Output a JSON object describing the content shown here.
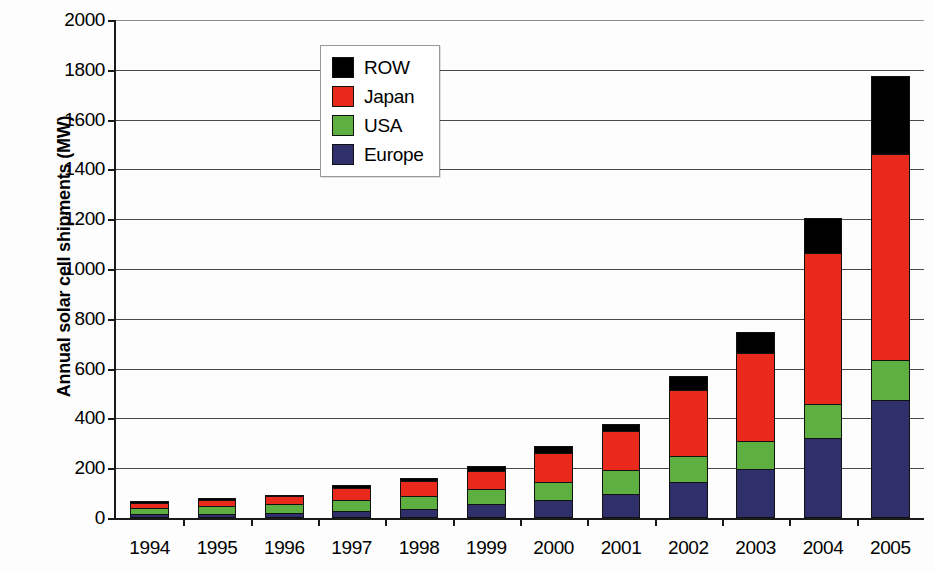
{
  "chart_data": {
    "type": "bar",
    "stacked": true,
    "title": "",
    "xlabel": "",
    "ylabel": "Annual solar cell shipments (MW)",
    "ylim": [
      0,
      2000
    ],
    "yticks": [
      0,
      200,
      400,
      600,
      800,
      1000,
      1200,
      1400,
      1600,
      1800,
      2000
    ],
    "grid": true,
    "legend_position": "top-left-inside",
    "categories": [
      "1994",
      "1995",
      "1996",
      "1997",
      "1998",
      "1999",
      "2000",
      "2001",
      "2002",
      "2003",
      "2004",
      "2005"
    ],
    "series": [
      {
        "name": "Europe",
        "color": "#2E2F6B",
        "values": [
          13,
          15,
          19,
          25,
          32,
          52,
          70,
          95,
          140,
          195,
          320,
          470
        ]
      },
      {
        "name": "USA",
        "color": "#5DAF3F",
        "values": [
          25,
          30,
          35,
          45,
          52,
          62,
          70,
          95,
          105,
          110,
          135,
          160
        ]
      },
      {
        "name": "Japan",
        "color": "#E8291C",
        "values": [
          18,
          25,
          30,
          48,
          62,
          70,
          120,
          155,
          265,
          355,
          605,
          830
        ]
      },
      {
        "name": "ROW",
        "color": "#000000",
        "values": [
          9,
          8,
          5,
          10,
          9,
          21,
          25,
          30,
          55,
          85,
          140,
          310
        ]
      }
    ],
    "totals": [
      65,
      78,
      89,
      128,
      155,
      205,
      285,
      375,
      565,
      745,
      1200,
      1770
    ]
  },
  "legend": {
    "items": [
      {
        "label": "ROW",
        "color": "#000000"
      },
      {
        "label": "Japan",
        "color": "#E8291C"
      },
      {
        "label": "USA",
        "color": "#5DAF3F"
      },
      {
        "label": "Europe",
        "color": "#2E2F6B"
      }
    ]
  },
  "axes": {
    "y_title": "Annual solar cell shipments (MW)",
    "y_tick_labels": [
      "0",
      "200",
      "400",
      "600",
      "800",
      "1000",
      "1200",
      "1400",
      "1600",
      "1800",
      "2000"
    ],
    "x_tick_labels": [
      "1994",
      "1995",
      "1996",
      "1997",
      "1998",
      "1999",
      "2000",
      "2001",
      "2002",
      "2003",
      "2004",
      "2005"
    ]
  }
}
